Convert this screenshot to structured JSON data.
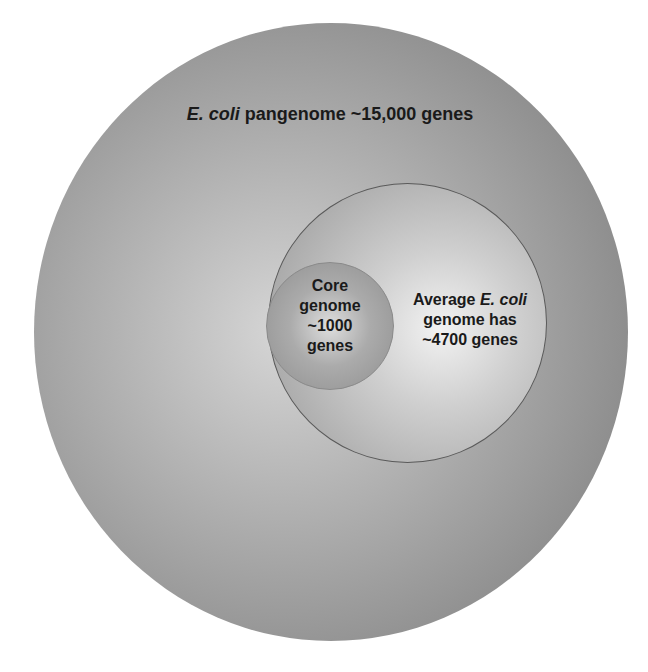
{
  "diagram": {
    "type": "nested-circles",
    "outer": {
      "species": "E. coli",
      "text": "pangenome ~15,000 genes",
      "genes": "~15,000"
    },
    "middle": {
      "prefix": "Average",
      "species": "E. coli",
      "line2": "genome has",
      "line3": "~4700 genes",
      "genes": "~4700"
    },
    "core": {
      "line1": "Core",
      "line2": "genome",
      "line3": "~1000",
      "line4": "genes",
      "genes": "~1000"
    }
  },
  "colors": {
    "outer_edge": "#808080",
    "outer_center": "#d6d6d6",
    "middle_center": "#f2f2f2",
    "middle_border": "#5a5a5a",
    "core_center": "#dedede",
    "text": "#1a1a1a",
    "background": "#ffffff"
  }
}
